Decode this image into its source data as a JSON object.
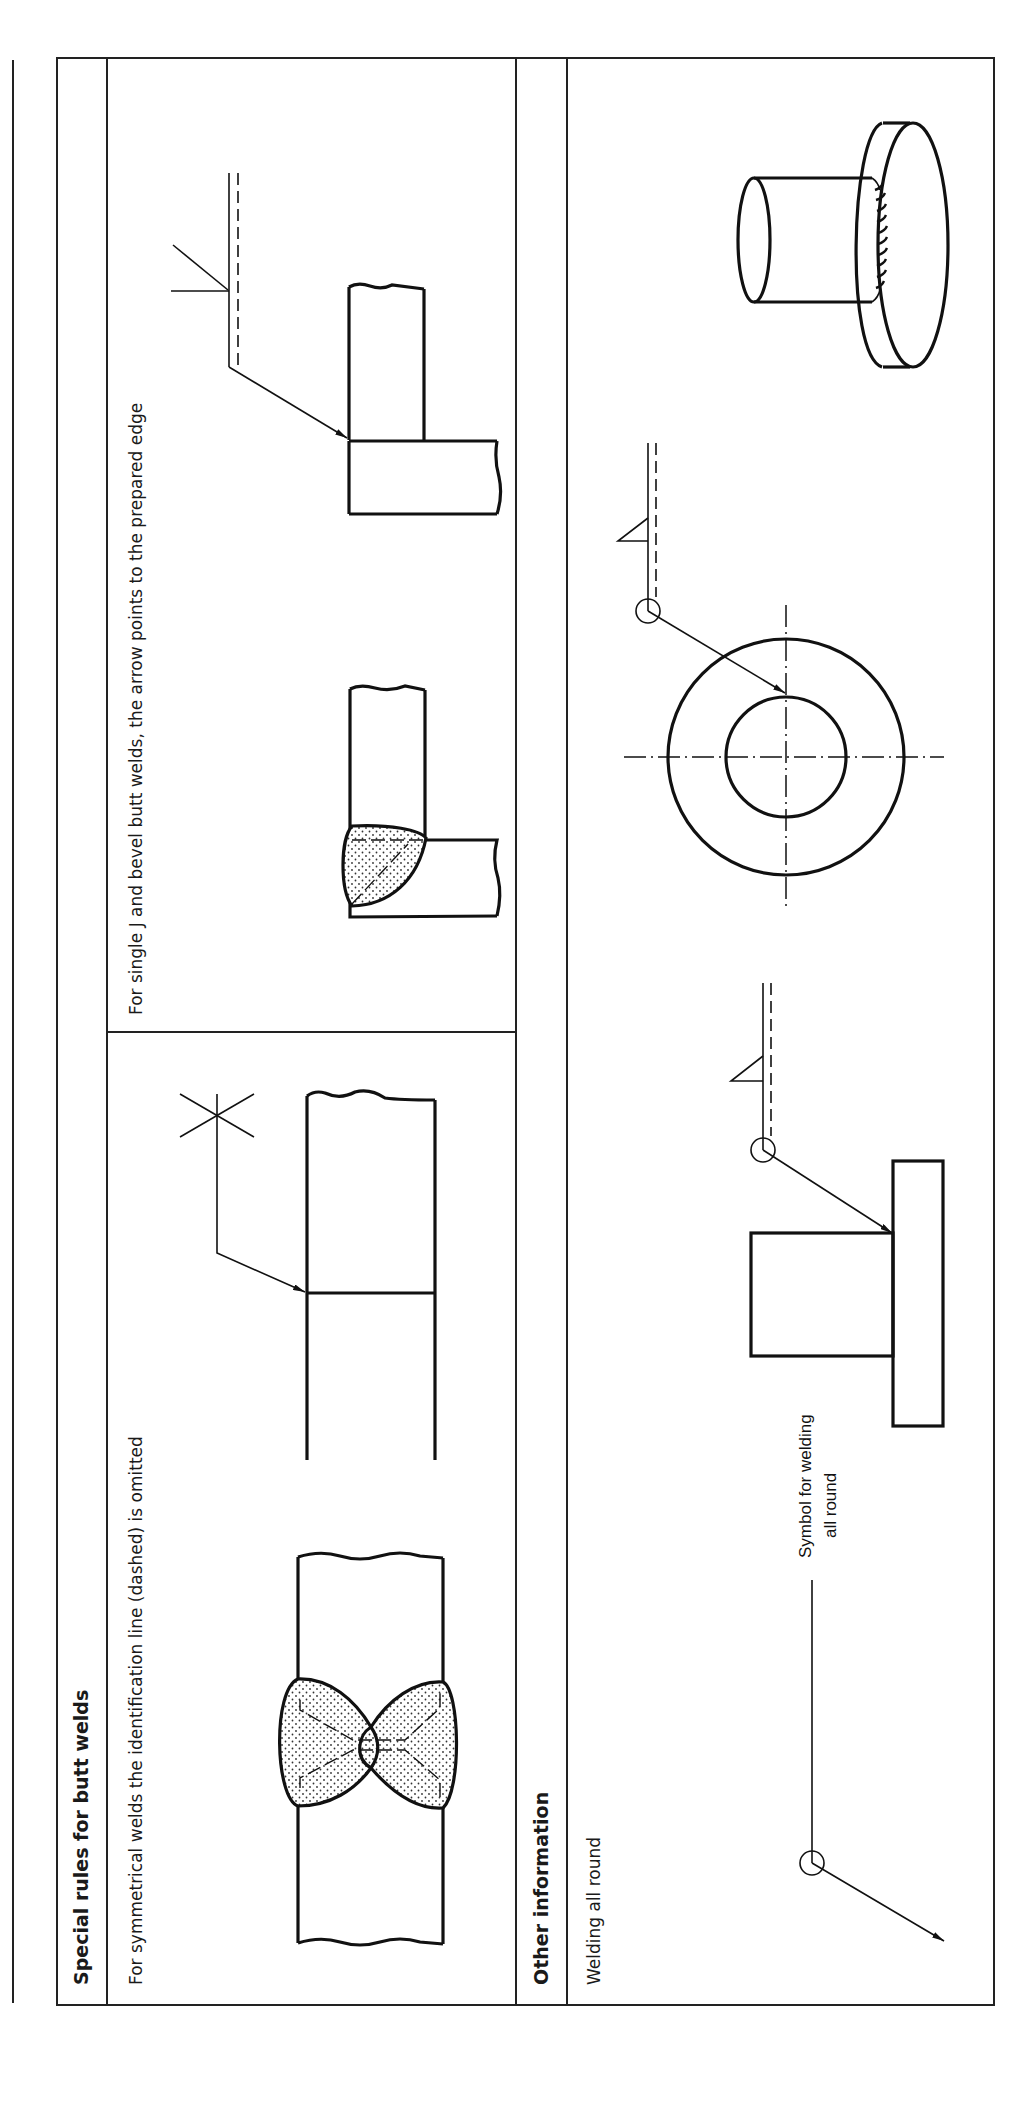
{
  "sections": [
    {
      "title": "Special rules for butt welds",
      "panels": [
        {
          "caption": "For symmetrical welds the identification line (dashed) is omitted",
          "figures": [
            "double-V butt weld section (dotted weld metal)",
            "butt joint with symmetrical weld symbol (X) and arrow"
          ]
        },
        {
          "caption": "For single J and bevel butt welds, the arrow points to the prepared edge",
          "figures": [
            "single bevel T-joint section (dotted weld metal)",
            "T-joint with bevel weld symbol, arrow to prepared edge"
          ]
        }
      ]
    },
    {
      "title": "Other information",
      "panels": [
        {
          "caption": "Welding all round",
          "annotation": "Symbol for welding all round",
          "annotation_lines": [
            "Symbol for welding",
            "all round"
          ],
          "figures": [
            "all-round symbol leader with circle",
            "tube on plate, fillet weld all round (side view)",
            "tube on plate, fillet weld all round (plan view)",
            "isometric view of tube welded to flange"
          ]
        }
      ]
    }
  ],
  "colors": {
    "ink": "#111111",
    "paper": "#ffffff",
    "frame": "#222222"
  }
}
